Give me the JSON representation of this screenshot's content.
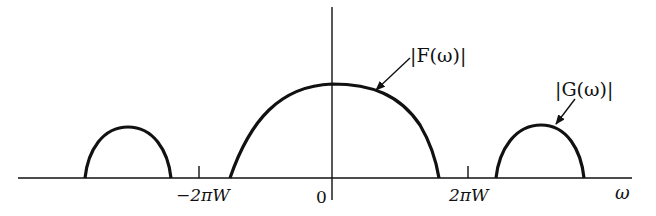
{
  "diagram": {
    "title": "",
    "axes": {
      "x_label": "ω",
      "ticks": [
        {
          "label": "−2πW",
          "x": 199
        },
        {
          "label": "0",
          "x": 332
        },
        {
          "label": "2πW",
          "x": 468
        }
      ]
    },
    "curves": [
      {
        "name": "|F(ω)|",
        "label": "|F(ω)|",
        "type": "baseband spectrum",
        "start_x": 230,
        "end_x": 439,
        "peak_y": 84
      },
      {
        "name": "|G(ω)|",
        "label": "|G(ω)|",
        "type": "shifted replica (right)",
        "start_x": 496,
        "end_x": 584,
        "peak_y": 125
      },
      {
        "name": "|G(ω)| (left)",
        "label": "",
        "type": "shifted replica (left)",
        "start_x": 85,
        "end_x": 171,
        "peak_y": 127
      }
    ],
    "annotations": {
      "f_label": "|F(ω)|",
      "g_label": "|G(ω)|"
    },
    "colors": {
      "ink": "#111111",
      "background": "#ffffff"
    }
  }
}
